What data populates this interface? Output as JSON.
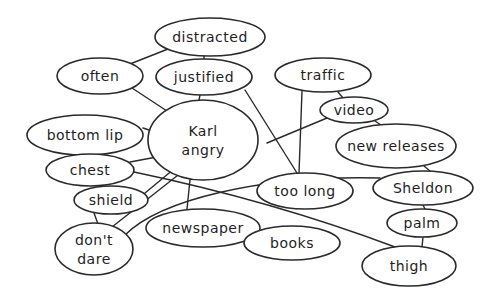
{
  "diagram": {
    "type": "mind-map",
    "central": "karl_angry",
    "nodes": [
      {
        "id": "distracted",
        "lines": [
          "distracted"
        ],
        "cx": 210,
        "cy": 37,
        "rx": 55,
        "ry": 19
      },
      {
        "id": "often",
        "lines": [
          "often"
        ],
        "cx": 100,
        "cy": 76,
        "rx": 43,
        "ry": 18
      },
      {
        "id": "justified",
        "lines": [
          "justified"
        ],
        "cx": 204,
        "cy": 77,
        "rx": 48,
        "ry": 18
      },
      {
        "id": "traffic",
        "lines": [
          "traffic"
        ],
        "cx": 323,
        "cy": 75,
        "rx": 48,
        "ry": 17
      },
      {
        "id": "video",
        "lines": [
          "video"
        ],
        "cx": 354,
        "cy": 110,
        "rx": 34,
        "ry": 13
      },
      {
        "id": "karl_angry",
        "lines": [
          "Karl",
          "angry"
        ],
        "cx": 203,
        "cy": 140,
        "rx": 55,
        "ry": 40
      },
      {
        "id": "bottom_lip",
        "lines": [
          "bottom lip"
        ],
        "cx": 85,
        "cy": 135,
        "rx": 58,
        "ry": 20
      },
      {
        "id": "new_releases",
        "lines": [
          "new releases"
        ],
        "cx": 396,
        "cy": 146,
        "rx": 60,
        "ry": 22
      },
      {
        "id": "chest",
        "lines": [
          "chest"
        ],
        "cx": 90,
        "cy": 170,
        "rx": 44,
        "ry": 16
      },
      {
        "id": "shield",
        "lines": [
          "shield"
        ],
        "cx": 111,
        "cy": 200,
        "rx": 37,
        "ry": 14
      },
      {
        "id": "too_long",
        "lines": [
          "too long"
        ],
        "cx": 305,
        "cy": 191,
        "rx": 48,
        "ry": 18
      },
      {
        "id": "sheldon",
        "lines": [
          "Sheldon"
        ],
        "cx": 423,
        "cy": 188,
        "rx": 50,
        "ry": 17
      },
      {
        "id": "newspaper",
        "lines": [
          "newspaper"
        ],
        "cx": 203,
        "cy": 228,
        "rx": 57,
        "ry": 19
      },
      {
        "id": "palm",
        "lines": [
          "palm"
        ],
        "cx": 422,
        "cy": 223,
        "rx": 35,
        "ry": 14
      },
      {
        "id": "dont_dare",
        "lines": [
          "don't",
          "dare"
        ],
        "cx": 94,
        "cy": 249,
        "rx": 39,
        "ry": 26
      },
      {
        "id": "books",
        "lines": [
          "books"
        ],
        "cx": 292,
        "cy": 243,
        "rx": 48,
        "ry": 17
      },
      {
        "id": "thigh",
        "lines": [
          "thigh"
        ],
        "cx": 409,
        "cy": 266,
        "rx": 47,
        "ry": 20
      }
    ],
    "edges": [
      {
        "from": "distracted",
        "to": "often",
        "d": "M168,49 L130,64"
      },
      {
        "from": "distracted",
        "to": "justified",
        "d": "M204,56 L204,60"
      },
      {
        "from": "often",
        "to": "karl_angry",
        "d": "M132,88 L170,113"
      },
      {
        "from": "justified",
        "to": "karl_angry",
        "d": "M200,95 L199,100"
      },
      {
        "from": "justified",
        "to": "too_long",
        "d": "M245,90 L297,173"
      },
      {
        "from": "traffic",
        "to": "too_long",
        "d": "M302,91 L299,173"
      },
      {
        "from": "traffic",
        "to": "video",
        "d": "M338,92 L343,98"
      },
      {
        "from": "video",
        "to": "new_releases",
        "d": "M375,121 L381,125"
      },
      {
        "from": "video",
        "to": "karl_angry",
        "d": "M327,118 L267,143"
      },
      {
        "from": "new_releases",
        "to": "sheldon",
        "d": "M424,166 L430,171"
      },
      {
        "from": "bottom_lip",
        "to": "karl_angry",
        "d": "M143,128 L149,130"
      },
      {
        "from": "chest",
        "to": "karl_angry",
        "d": "M130,162 L162,156"
      },
      {
        "from": "chest",
        "to": "thigh",
        "d": "M134,172 C220,190 310,215 395,247"
      },
      {
        "from": "shield",
        "to": "karl_angry",
        "d": "M145,193 L180,164"
      },
      {
        "from": "shield",
        "to": "dont_dare",
        "d": "M94,213 L98,224"
      },
      {
        "from": "dont_dare",
        "to": "karl_angry",
        "d": "M112,227 L187,168"
      },
      {
        "from": "dont_dare",
        "to": "sheldon",
        "d": "M125,235 C160,200 260,175 380,178"
      },
      {
        "from": "karl_angry",
        "to": "newspaper",
        "d": "M191,170 L187,209"
      },
      {
        "from": "newspaper",
        "to": "books",
        "d": "M253,236 L261,242"
      },
      {
        "from": "sheldon",
        "to": "palm",
        "d": "M423,205 L425,209"
      },
      {
        "from": "palm",
        "to": "thigh",
        "d": "M423,237 L422,247"
      }
    ]
  }
}
